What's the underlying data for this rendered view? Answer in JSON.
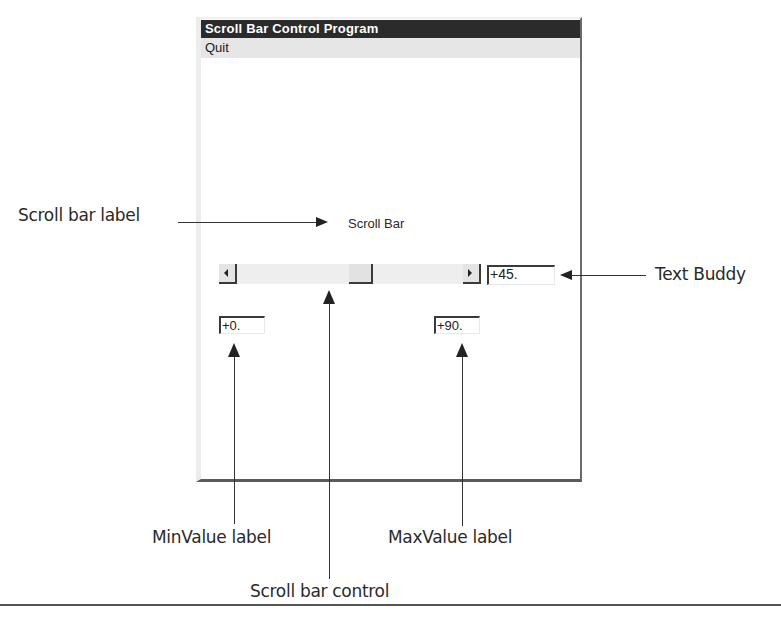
{
  "window": {
    "title": "Scroll Bar Control Program",
    "menu": [
      {
        "label": "Quit"
      }
    ],
    "scroll_bar_label": "Scroll Bar",
    "scrollbar": {
      "min": 0,
      "max": 90,
      "value": 45,
      "left_arrow_icon": "left-arrow-icon",
      "right_arrow_icon": "right-arrow-icon"
    },
    "text_buddy_value": "+45.",
    "min_value_label": "+0.",
    "max_value_label": "+90."
  },
  "annotations": {
    "scroll_bar_label": "Scroll bar label",
    "text_buddy": "Text Buddy",
    "min_value_label": "MinValue label",
    "max_value_label": "MaxValue label",
    "scroll_bar_control": "Scroll bar control"
  },
  "colors": {
    "titlebar_bg": "#2b2b2b",
    "menubar_bg": "#e6e6e6",
    "scroll_track": "#eeeeee"
  }
}
